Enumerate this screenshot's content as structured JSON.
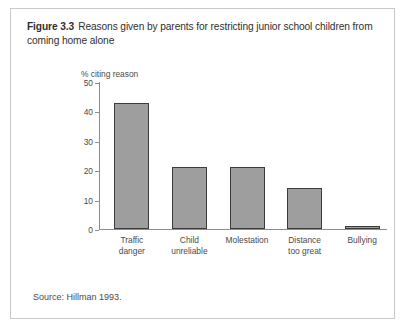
{
  "figure": {
    "label": "Figure 3.3",
    "caption": "Reasons given by parents for restricting junior school children from coming home alone",
    "source": "Source: Hillman 1993."
  },
  "chart_data": {
    "type": "bar",
    "title": "Reasons given by parents for restricting junior school children from coming home alone",
    "categories": [
      "Traffic danger",
      "Child unreliable",
      "Molestation",
      "Distance too great",
      "Bullying"
    ],
    "category_lines": [
      [
        "Traffic",
        "danger"
      ],
      [
        "Child",
        "unreliable"
      ],
      [
        "Molestation"
      ],
      [
        "Distance",
        "too great"
      ],
      [
        "Bullying"
      ]
    ],
    "values": [
      43,
      21,
      21,
      14,
      1
    ],
    "xlabel": "",
    "ylabel": "% citing reason",
    "ylim": [
      0,
      50
    ],
    "yticks": [
      0,
      10,
      20,
      30,
      40,
      50
    ],
    "ytick_labels": [
      "0",
      "10",
      "20",
      "30",
      "40",
      "50"
    ],
    "grid": false,
    "legend": false,
    "bar_color": "#9e9e9e",
    "bar_edge_color": "#3c3c3c",
    "axis_color": "#8c8c8c"
  }
}
